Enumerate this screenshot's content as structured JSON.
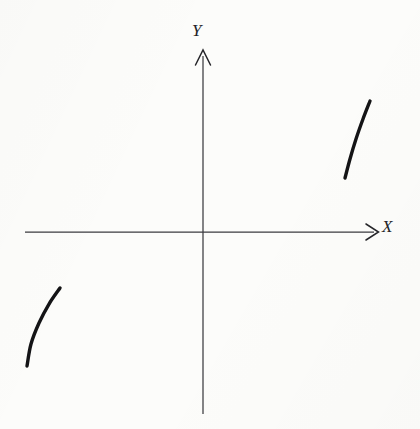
{
  "figure": {
    "background_color": "#fcfcfa",
    "ink_color": "#141416",
    "axis_color": "#3b3b3f",
    "width": 420,
    "height": 429
  },
  "labels": {
    "y_axis": "Y",
    "x_axis": "X"
  },
  "chart_data": {
    "type": "line",
    "title": "",
    "subtitle": "",
    "xlabel": "X",
    "ylabel": "Y",
    "xlim": [
      -178,
      175
    ],
    "ylim": [
      -182,
      182
    ],
    "grid": false,
    "legend": null,
    "annotations": [],
    "axes": {
      "origin_px": [
        203,
        232
      ],
      "x_axis_px": {
        "from": [
          25,
          232
        ],
        "to": [
          378,
          232
        ],
        "arrow": "right"
      },
      "y_axis_px": {
        "from": [
          203,
          414
        ],
        "to": [
          203,
          50
        ],
        "arrow": "up"
      },
      "x_tick_labels": [],
      "y_tick_labels": []
    },
    "series": [
      {
        "name": "branch-quadrant-I",
        "quadrant": "I",
        "stroke_width_px": 3.4,
        "concavity": "concave-left",
        "points_px": [
          [
            370,
            101
          ],
          [
            363,
            119
          ],
          [
            356,
            139
          ],
          [
            350,
            159
          ],
          [
            345,
            178
          ]
        ],
        "points_data": [
          [
            167,
            131
          ],
          [
            160,
            113
          ],
          [
            153,
            93
          ],
          [
            147,
            73
          ],
          [
            142,
            54
          ]
        ]
      },
      {
        "name": "branch-quadrant-III",
        "quadrant": "III",
        "stroke_width_px": 3.4,
        "concavity": "concave-right",
        "points_px": [
          [
            60,
            288
          ],
          [
            49,
            304
          ],
          [
            39,
            323
          ],
          [
            31,
            344
          ],
          [
            27,
            366
          ]
        ],
        "points_data": [
          [
            -143,
            -56
          ],
          [
            -154,
            -72
          ],
          [
            -164,
            -91
          ],
          [
            -172,
            -112
          ],
          [
            -176,
            -134
          ]
        ]
      }
    ]
  }
}
